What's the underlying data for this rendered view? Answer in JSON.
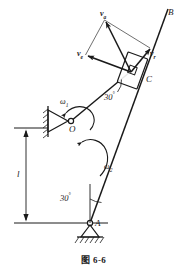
{
  "figure": {
    "caption": "图  6-6",
    "caption_number": "6-6",
    "caption_word": "图"
  },
  "labels": {
    "point_B": "B",
    "point_C": "C",
    "point_O": "O",
    "point_A": "A",
    "length_l": "l",
    "v_absolute": "v",
    "v_absolute_sub": "a",
    "v_entrainment": "v",
    "v_entrainment_sub": "e",
    "v_relative": "v",
    "v_relative_sub": "r",
    "omega1": "ω",
    "omega1_sub": "1",
    "omega2": "ω",
    "omega2_sub": "2",
    "angle_upper": "30",
    "angle_upper_unit": "°",
    "angle_lower": "30",
    "angle_lower_unit": "°"
  },
  "geometry": {
    "point_O": [
      71,
      121
    ],
    "point_A": [
      90,
      223
    ],
    "point_C": [
      133,
      70
    ],
    "point_B": [
      165,
      14
    ],
    "v_apex": [
      104,
      19
    ],
    "v_e_tip": [
      84,
      57
    ],
    "v_r_tip": [
      150,
      48
    ],
    "bar_OC_angle_deg": -48,
    "bar_AB_angle_deg": -60,
    "dimension_x": 26,
    "dimension_top_y": 131,
    "dimension_bottom_y": 222
  },
  "colors": {
    "stroke": "#1a1a1a",
    "background": "#ffffff",
    "thin_stroke": "#555555"
  }
}
